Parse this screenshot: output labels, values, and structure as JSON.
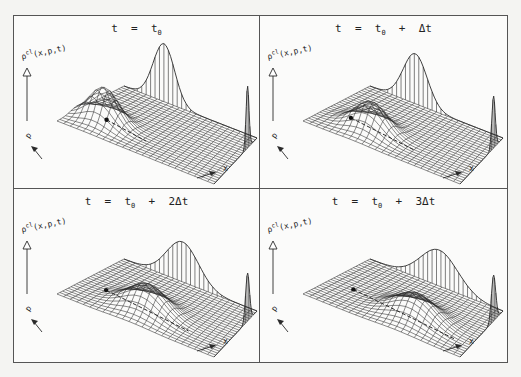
{
  "figure": {
    "panels": [
      {
        "id": "t0",
        "title_prefix": "t  =  t",
        "title_sub": "0",
        "title_suffix": "",
        "z_label": "ρ",
        "z_label_sup": "cl",
        "z_label_args": "(x,p,t)",
        "x_axis_label": "x",
        "p_axis_label": "p",
        "packet": {
          "u": 0.18,
          "v": 0.3,
          "height": 34,
          "width": 0.09
        },
        "x_marginal": {
          "center": 0.3,
          "height": 58,
          "width": 0.08
        },
        "p_marginal": {
          "center": 0.22,
          "height": 62,
          "width": 0.035
        },
        "trajectory_dot": {
          "u": 0.18,
          "v": 0.34
        }
      },
      {
        "id": "t0+dt",
        "title_prefix": "t  =  t",
        "title_sub": "0",
        "title_suffix": "  +  Δt",
        "z_label": "ρ",
        "z_label_sup": "cl",
        "z_label_args": "(x,p,t)",
        "x_axis_label": "x",
        "p_axis_label": "p",
        "packet": {
          "u": 0.32,
          "v": 0.3,
          "height": 28,
          "width": 0.1
        },
        "x_marginal": {
          "center": 0.34,
          "height": 50,
          "width": 0.09
        },
        "p_marginal": {
          "center": 0.22,
          "height": 52,
          "width": 0.04
        },
        "trajectory_dot": {
          "u": 0.16,
          "v": 0.36
        }
      },
      {
        "id": "t0+2dt",
        "title_prefix": "t  =  t",
        "title_sub": "0",
        "title_suffix": "  +  2Δt",
        "z_label": "ρ",
        "z_label_sup": "cl",
        "z_label_args": "(x,p,t)",
        "x_axis_label": "x",
        "p_axis_label": "p",
        "packet": {
          "u": 0.46,
          "v": 0.32,
          "height": 26,
          "width": 0.12
        },
        "x_marginal": {
          "center": 0.44,
          "height": 40,
          "width": 0.12
        },
        "p_marginal": {
          "center": 0.22,
          "height": 48,
          "width": 0.045
        },
        "trajectory_dot": {
          "u": 0.16,
          "v": 0.38
        }
      },
      {
        "id": "t0+3dt",
        "title_prefix": "t  =  t",
        "title_sub": "0",
        "title_suffix": "  +  3Δt",
        "z_label": "ρ",
        "z_label_sup": "cl",
        "z_label_args": "(x,p,t)",
        "x_axis_label": "x",
        "p_axis_label": "p",
        "packet": {
          "u": 0.6,
          "v": 0.34,
          "height": 24,
          "width": 0.13
        },
        "x_marginal": {
          "center": 0.52,
          "height": 36,
          "width": 0.14
        },
        "p_marginal": {
          "center": 0.22,
          "height": 46,
          "width": 0.05
        },
        "trajectory_dot": {
          "u": 0.16,
          "v": 0.4
        }
      }
    ]
  },
  "colors": {
    "line": "#2a2a2a",
    "frame": "#555555",
    "paper": "#fbfbfa"
  }
}
